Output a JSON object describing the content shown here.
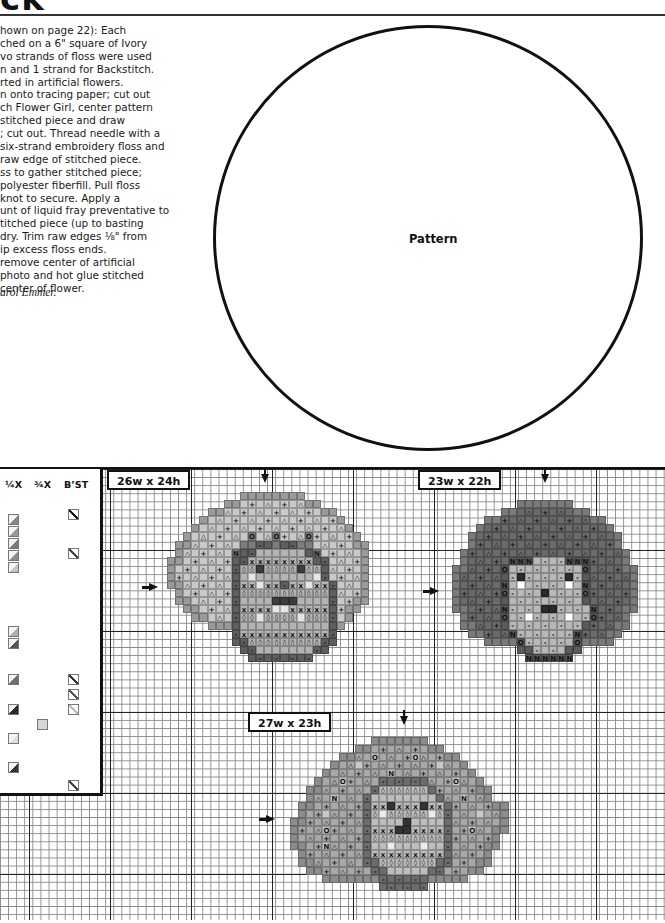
{
  "page": {
    "title_fragment": "ck",
    "instructions_lines": [
      "hown on page 22): Each",
      "ched on a 6\" square of Ivory",
      "vo strands of floss were used",
      "n and 1 strand for Backstitch.",
      "rted in artificial flowers.",
      "n onto tracing paper; cut out",
      "ch Flower Girl, center pattern",
      " stitched piece and draw",
      "; cut out. Thread needle with a",
      "six-strand embroidery floss and",
      " raw edge of stitched piece.",
      "ss to gather stitched piece;",
      " polyester fiberfill. Pull floss",
      "knot to secure. Apply a",
      "unt of liquid fray preventative to",
      "titched piece (up to basting",
      "dry. Trim raw edges ⅛\" from",
      "ip excess floss ends.",
      " remove center of artificial",
      " photo and hot glue stitched",
      " center of flower."
    ],
    "credit": "arol Emmer.",
    "pattern_label": "Pattern"
  },
  "key": {
    "headers": {
      "quarter": "¼X",
      "three_quarter": "¾X",
      "backstitch": "B’ST"
    },
    "quarter_swatches": [
      {
        "top": 45,
        "color": "#888888"
      },
      {
        "top": 57,
        "color": "#9a9a9a"
      },
      {
        "top": 69,
        "color": "#7a7a7a"
      },
      {
        "top": 81,
        "color": "#8c8c8c"
      },
      {
        "top": 93,
        "color": "#c4c4c4"
      },
      {
        "top": 157,
        "color": "#b0b0b0"
      },
      {
        "top": 169,
        "color": "#555555"
      },
      {
        "top": 205,
        "color": "#707070"
      },
      {
        "top": 235,
        "color": "#2a2a2a"
      },
      {
        "top": 264,
        "color": "#e0e0e0"
      },
      {
        "top": 293,
        "color": "#333333"
      }
    ],
    "three_quarter_swatches": [
      {
        "top": 250,
        "color": "#d6d6d6"
      }
    ],
    "backstitch_swatches": [
      {
        "top": 40,
        "color": "#111111"
      },
      {
        "top": 79,
        "color": "#444444"
      },
      {
        "top": 205,
        "color": "#333333"
      },
      {
        "top": 220,
        "color": "#555555"
      },
      {
        "top": 235,
        "color": "#bbbbbb"
      },
      {
        "top": 311,
        "color": "#444444"
      }
    ]
  },
  "charts": [
    {
      "id": "flower-girl-1",
      "size_label": "26w x 24h",
      "label_pos": {
        "left": 107,
        "top": 470
      },
      "arrow_down": {
        "left": 261,
        "top": 474
      },
      "arrow_right": {
        "left": 149,
        "top": 583
      },
      "origin": {
        "left": 159,
        "top": 492
      },
      "cols": 26,
      "palette": {
        "a": "#9a9a9a",
        "b": "#c9c9c9",
        "c": "#7d7d7d",
        "d": "#5e5e5e",
        "e": "#b4b4b4",
        "f": "#e6e6e6",
        "g": "#3c3c3c",
        ".": "transparent"
      },
      "rows": [
        "..........aaaaaaaa........",
        "........aabbbbbbbbaa......",
        "......aabbbbbbbbbbbbaa....",
        ".....abbbbbbbbbbbbbbbba...",
        "....abbbbbbbbbbbbbbbbbba..",
        "...abbbbbbbcbbcbbbcbbbbba.",
        "..aabbbbbbccddcddccbbbbbaa",
        "..abbbbbbcddeeeeeedcbbbbba",
        ".aabbbbbbddeeeeeeeeddbbbba",
        ".abbbbbbbdeegeeeegeedbbbba",
        ".abbbbbbbdefeeeeeeefdbbbba",
        ".aabbbbbbdeefeedeefeedbbba",
        "..abbbbbbdeeeeeeeeeeedbbba",
        "..aabbbbbdeeeegggeeeedbbaa",
        "...aabbbbdeeeeffeeeeedbaa.",
        "....aabbbdeefeeeefeeedba..",
        "......aaadeeeeeeeeeeeda...",
        ".........deeeeeeeeeeed....",
        ".........ddeeeeeeeeedd....",
        "..........ddeeeeeeedd.....",
        "...........dddddddd.......",
        "..........................",
        "..........................",
        ".........................."
      ]
    },
    {
      "id": "flower-girl-2",
      "size_label": "23w x 22h",
      "label_pos": {
        "left": 418,
        "top": 470
      },
      "arrow_down": {
        "left": 541,
        "top": 474
      },
      "arrow_right": {
        "left": 430,
        "top": 587
      },
      "origin": {
        "left": 452,
        "top": 500
      },
      "cols": 23,
      "palette": {
        "a": "#7a7a7a",
        "b": "#6a6a6a",
        "c": "#5a5a5a",
        "d": "#b8b8b8",
        "e": "#dcdcdc",
        "f": "#ffffff",
        "g": "#2a2a2a",
        ".": "transparent"
      },
      "rows": [
        "........aaaaaaa........",
        "......aabbbbbbbaa......",
        "....aabbbbbbbbbbbaa....",
        "...abbbbbbbbbbbbbbba...",
        "..abbbbbbbbbbbbbbbbba..",
        "..abbbbbbbbbbbbbbbbba..",
        ".abbbbbbbbbbbbbbbbbbba.",
        ".abbbbbcccddddcccbbbba.",
        "aabbbbcdddddddddcbbbbaa",
        "abbbbbcdgdddddgdcbbbbba",
        "abbbbbcdfdddddfdcbbbbba",
        "abbbbbcddddgddddcbbbbba",
        "abbbbbcdddddddddcbbbbba",
        "aabbbbcddddggddddcbbbaa",
        ".abbbbcddfddddfddcbbba.",
        ".aabbbcdddddddddcbbbaa.",
        "..aabbbcdddddddcbbbaa..",
        "....aaaacddddddcaaaa...",
        "........ccddddcc.......",
        ".........cccccc........",
        ".......................",
        "......................."
      ]
    },
    {
      "id": "flower-girl-3",
      "size_label": "27w x 23h",
      "label_pos": {
        "left": 248,
        "top": 712
      },
      "arrow_down": {
        "left": 400,
        "top": 716
      },
      "arrow_right": {
        "left": 266,
        "top": 815
      },
      "origin": {
        "left": 290,
        "top": 737
      },
      "cols": 27,
      "palette": {
        "a": "#8c8c8c",
        "b": "#a8a8a8",
        "c": "#c8c8c8",
        "d": "#6c6c6c",
        "e": "#bdbdbd",
        "f": "#ececec",
        "g": "#333333",
        ".": "transparent"
      },
      "rows": [
        "..........aaaaaaa..........",
        "........aabbbbbbbaa........",
        "......aabbcbbbbcbbbaa......",
        ".....abbcbbbbbbbbbcbba.....",
        "....abbbbbbbcbbbbbbbbba....",
        "...abbcbbbbddddddbbbcbba...",
        "..aabbbbbbdeeeeeedbbbbbaa..",
        "..abbcbbbdeeeeeeeedbbcbba..",
        ".aabbbbbbdeegeeegeedbbbbbaa",
        ".abbcbbbbdefeeeeefedbbbcbba",
        "aabbbbbbbdeeeegeeeedbbbbbba",
        "abbbcbbbbdeeeggeeeedbbcbbaa",
        "abbbbbbbbdeeeeeeeeedbbbbba.",
        "aabbcbbbbdeefeeefeedbbbbaa.",
        ".abbbbbbbdeeeeeeeeedbbbba..",
        ".aabbbbbbddeeeeeeeddbbbaa..",
        "..aabbbbbbddeeeeeddbbbaa...",
        "....aaaaaaaddddddaaaaa.....",
        "...........dddddd..........",
        "...........................",
        "...........................",
        "...........................",
        "..........................."
      ]
    }
  ]
}
